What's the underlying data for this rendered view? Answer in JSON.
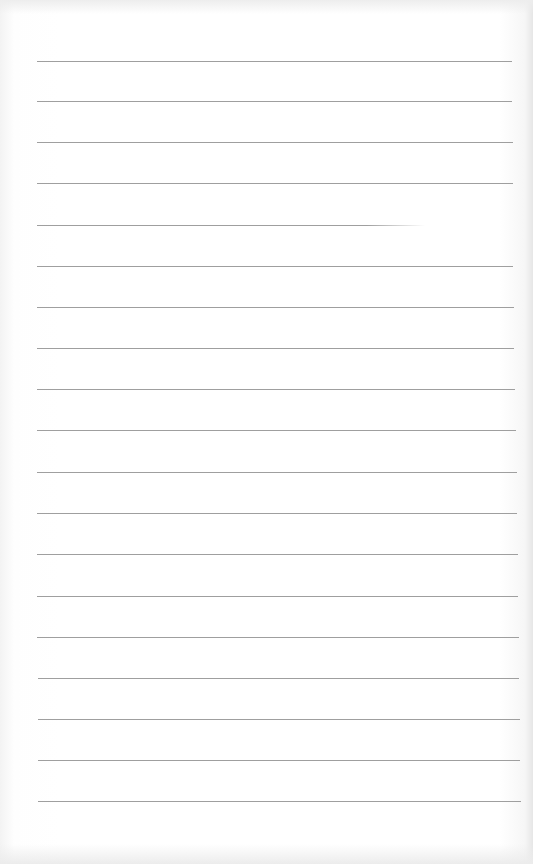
{
  "page": {
    "type": "lined-paper",
    "background_color": "#ffffff",
    "rule_color": "#8e8e8e"
  },
  "rules": [
    {
      "y": 61,
      "x1": 37,
      "x2": 512
    },
    {
      "y": 101,
      "x1": 37,
      "x2": 512
    },
    {
      "y": 142,
      "x1": 37,
      "x2": 513
    },
    {
      "y": 183,
      "x1": 37,
      "x2": 513
    },
    {
      "y": 225,
      "x1": 37,
      "x2": 425
    },
    {
      "y": 266,
      "x1": 37,
      "x2": 513
    },
    {
      "y": 307,
      "x1": 37,
      "x2": 514
    },
    {
      "y": 348,
      "x1": 37,
      "x2": 514
    },
    {
      "y": 389,
      "x1": 37,
      "x2": 515
    },
    {
      "y": 430,
      "x1": 37,
      "x2": 516
    },
    {
      "y": 472,
      "x1": 37,
      "x2": 517
    },
    {
      "y": 513,
      "x1": 37,
      "x2": 517
    },
    {
      "y": 554,
      "x1": 37,
      "x2": 518
    },
    {
      "y": 596,
      "x1": 37,
      "x2": 518
    },
    {
      "y": 637,
      "x1": 37,
      "x2": 519
    },
    {
      "y": 678,
      "x1": 38,
      "x2": 519
    },
    {
      "y": 719,
      "x1": 38,
      "x2": 520
    },
    {
      "y": 760,
      "x1": 38,
      "x2": 520
    },
    {
      "y": 801,
      "x1": 38,
      "x2": 521
    }
  ]
}
